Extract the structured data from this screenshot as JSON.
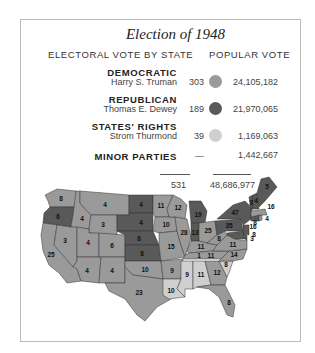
{
  "chart_data": {
    "type": "table",
    "title": "Election of 1948",
    "columns": [
      "Electoral Vote by State",
      "Popular Vote"
    ],
    "headers": {
      "left": "ELECTORAL VOTE BY STATE",
      "right": "POPULAR VOTE"
    },
    "parties": [
      {
        "party": "DEMOCRATIC",
        "candidate": "Harry S. Truman",
        "electoral": "303",
        "popular": "24,105,182",
        "color": "#9a9a9a"
      },
      {
        "party": "REPUBLICAN",
        "candidate": "Thomas E. Dewey",
        "electoral": "189",
        "popular": "21,970,065",
        "color": "#595959"
      },
      {
        "party": "STATES' RIGHTS",
        "candidate": "Strom Thurmond",
        "electoral": "39",
        "popular": "1,169,063",
        "color": "#cfcfcf"
      },
      {
        "party": "MINOR PARTIES",
        "candidate": "",
        "electoral": "—",
        "popular": "1,442,667",
        "color": ""
      }
    ],
    "totals": {
      "electoral": "531",
      "popular": "48,686,977"
    },
    "map_legend": {
      "D": "#9a9a9a",
      "R": "#595959",
      "SR": "#cfcfcf"
    },
    "states": [
      {
        "id": "WA",
        "ev": "8",
        "p": "D"
      },
      {
        "id": "OR",
        "ev": "6",
        "p": "R"
      },
      {
        "id": "CA",
        "ev": "25",
        "p": "D"
      },
      {
        "id": "ID",
        "ev": "4",
        "p": "D"
      },
      {
        "id": "NV",
        "ev": "3",
        "p": "D"
      },
      {
        "id": "MT",
        "ev": "4",
        "p": "D"
      },
      {
        "id": "WY",
        "ev": "3",
        "p": "D"
      },
      {
        "id": "UT",
        "ev": "4",
        "p": "D"
      },
      {
        "id": "AZ",
        "ev": "4",
        "p": "D"
      },
      {
        "id": "CO",
        "ev": "6",
        "p": "D"
      },
      {
        "id": "NM",
        "ev": "4",
        "p": "D"
      },
      {
        "id": "ND",
        "ev": "4",
        "p": "R"
      },
      {
        "id": "SD",
        "ev": "4",
        "p": "R"
      },
      {
        "id": "NE",
        "ev": "6",
        "p": "R"
      },
      {
        "id": "KS",
        "ev": "8",
        "p": "R"
      },
      {
        "id": "OK",
        "ev": "10",
        "p": "D"
      },
      {
        "id": "TX",
        "ev": "23",
        "p": "D"
      },
      {
        "id": "MN",
        "ev": "11",
        "p": "D"
      },
      {
        "id": "IA",
        "ev": "10",
        "p": "D"
      },
      {
        "id": "MO",
        "ev": "15",
        "p": "D"
      },
      {
        "id": "AR",
        "ev": "9",
        "p": "D"
      },
      {
        "id": "LA",
        "ev": "10",
        "p": "SR"
      },
      {
        "id": "WI",
        "ev": "12",
        "p": "D"
      },
      {
        "id": "IL",
        "ev": "28",
        "p": "D"
      },
      {
        "id": "MI",
        "ev": "19",
        "p": "R"
      },
      {
        "id": "IN",
        "ev": "13",
        "p": "R"
      },
      {
        "id": "OH",
        "ev": "25",
        "p": "D"
      },
      {
        "id": "KY",
        "ev": "11",
        "p": "D"
      },
      {
        "id": "TN",
        "ev": "11",
        "p": "D",
        "extra": "1",
        "extra_p": "SR"
      },
      {
        "id": "MS",
        "ev": "9",
        "p": "SR"
      },
      {
        "id": "AL",
        "ev": "11",
        "p": "SR"
      },
      {
        "id": "GA",
        "ev": "12",
        "p": "D"
      },
      {
        "id": "FL",
        "ev": "8",
        "p": "D"
      },
      {
        "id": "SC",
        "ev": "8",
        "p": "SR"
      },
      {
        "id": "NC",
        "ev": "14",
        "p": "D"
      },
      {
        "id": "VA",
        "ev": "11",
        "p": "D"
      },
      {
        "id": "WV",
        "ev": "8",
        "p": "D"
      },
      {
        "id": "PA",
        "ev": "35",
        "p": "R"
      },
      {
        "id": "NY",
        "ev": "47",
        "p": "R"
      },
      {
        "id": "NJ",
        "ev": "16",
        "p": "R"
      },
      {
        "id": "DE",
        "ev": "3",
        "p": "R"
      },
      {
        "id": "MD",
        "ev": "8",
        "p": "R"
      },
      {
        "id": "CT",
        "ev": "8",
        "p": "R"
      },
      {
        "id": "RI",
        "ev": "4",
        "p": "D"
      },
      {
        "id": "MA",
        "ev": "16",
        "p": "D"
      },
      {
        "id": "VT",
        "ev": "3",
        "p": "R"
      },
      {
        "id": "NH",
        "ev": "4",
        "p": "R"
      },
      {
        "id": "ME",
        "ev": "5",
        "p": "R"
      }
    ]
  }
}
